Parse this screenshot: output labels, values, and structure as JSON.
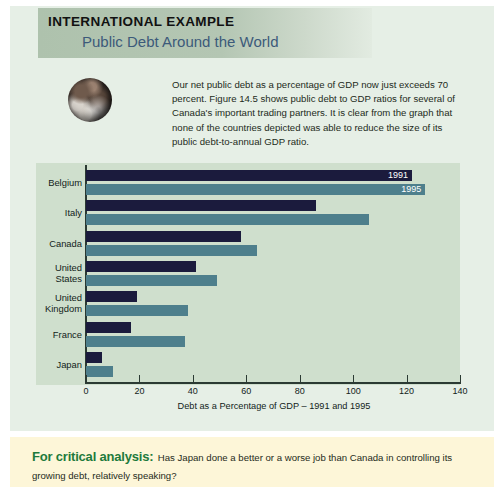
{
  "header": {
    "eyebrow": "INTERNATIONAL EXAMPLE",
    "headline": "Public Debt Around the World"
  },
  "icons": {
    "globe": "earth-globe-icon"
  },
  "intro": {
    "text": "Our net public debt as a percentage of GDP now just exceeds 70 percent. Figure 14.5 shows public debt to GDP ratios for several of Canada's important trading partners. It is clear from the graph that none of the countries depicted was able to reduce the size of its public debt-to-annual GDP ratio."
  },
  "critical": {
    "label": "For critical analysis:",
    "text": "Has Japan done a better or a worse job than Canada in controlling its growing debt, relatively speaking?"
  },
  "colors": {
    "paper": "#e6efe6",
    "plot_bg": "#cfdfcd",
    "band": "#aec2ad",
    "series_1991": "#1b1b3d",
    "series_1995": "#4e7f8c",
    "headline": "#3c5a7a",
    "critical_label": "#1e7a3c",
    "critical_bg": "#fdf6d8"
  },
  "chart_data": {
    "type": "bar",
    "orientation": "horizontal",
    "title": "",
    "xlabel": "Debt as a Percentage of GDP – 1991 and 1995",
    "ylabel": "",
    "xlim": [
      0,
      140
    ],
    "xticks": [
      0,
      20,
      40,
      60,
      80,
      100,
      120,
      140
    ],
    "grid": false,
    "legend": [
      "1991",
      "1995"
    ],
    "legend_position": "inside-top-right-bar-labels",
    "categories": [
      "Belgium",
      "Italy",
      "Canada",
      "United States",
      "United Kingdom",
      "France",
      "Japan"
    ],
    "series": [
      {
        "name": "1991",
        "values": [
          122,
          86,
          58,
          41,
          19,
          17,
          6
        ]
      },
      {
        "name": "1995",
        "values": [
          127,
          106,
          64,
          49,
          38,
          37,
          10
        ]
      }
    ]
  }
}
